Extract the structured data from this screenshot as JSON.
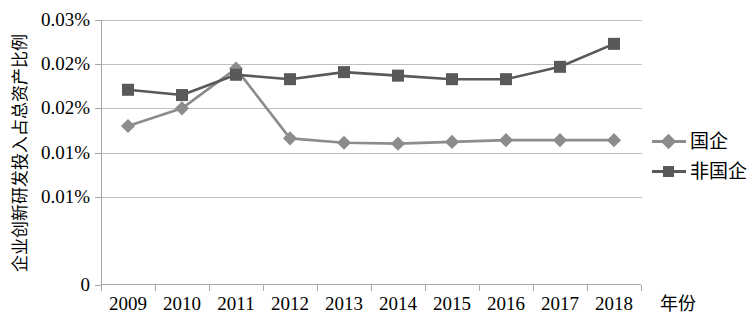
{
  "chart_data": {
    "type": "line",
    "title": "",
    "xlabel": "年份",
    "ylabel": "企业创新研发投入占总资产比例",
    "x": [
      "2009",
      "2010",
      "2011",
      "2012",
      "2013",
      "2014",
      "2015",
      "2016",
      "2017",
      "2018"
    ],
    "categories": [
      "2009",
      "2010",
      "2011",
      "2012",
      "2013",
      "2014",
      "2015",
      "2016",
      "2017",
      "2018"
    ],
    "ytick_labels": [
      "0.03%",
      "0.02%",
      "0.02%",
      "0.01%",
      "0.01%",
      "0"
    ],
    "ytick_values": [
      0.03,
      0.025,
      0.02,
      0.015,
      0.01,
      0
    ],
    "ylim": [
      0,
      0.03
    ],
    "grid": true,
    "legend_position": "right",
    "series": [
      {
        "name": "国企",
        "marker": "diamond",
        "color": "#8c8c8c",
        "values": [
          0.018,
          0.02,
          0.0245,
          0.0166,
          0.0161,
          0.016,
          0.0162,
          0.0164,
          0.0164,
          0.0164
        ]
      },
      {
        "name": "非国企",
        "marker": "square",
        "color": "#595959",
        "values": [
          0.0221,
          0.0215,
          0.0238,
          0.0233,
          0.0241,
          0.0237,
          0.0233,
          0.0233,
          0.0247,
          0.0273
        ]
      }
    ]
  },
  "axis": {
    "x_title": "年份",
    "y_title": "企业创新研发投入占总资产比例"
  },
  "legend": {
    "items": [
      {
        "label": "国企",
        "marker": "diamond-marker",
        "color": "#8c8c8c"
      },
      {
        "label": "非国企",
        "marker": "square-marker",
        "color": "#595959"
      }
    ]
  },
  "colors": {
    "series_state_owned": "#8c8c8c",
    "series_non_state_owned": "#595959",
    "gridline": "#bfbfbf",
    "axis": "#a6a6a6",
    "text": "#000000",
    "background": "#ffffff"
  }
}
